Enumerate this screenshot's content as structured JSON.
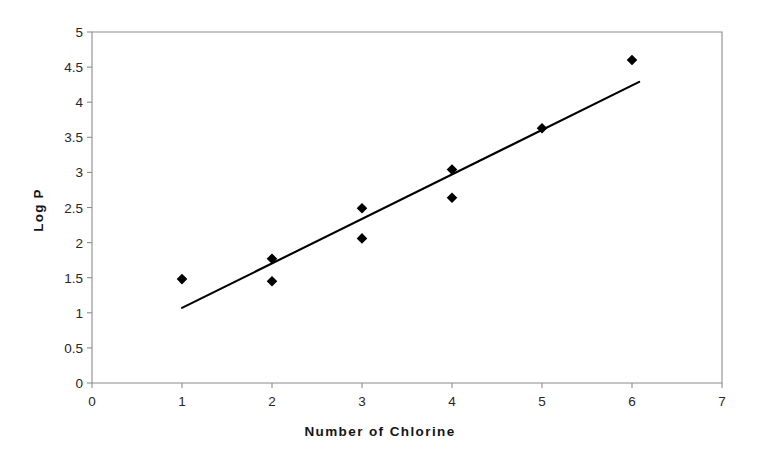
{
  "chart_data": {
    "type": "scatter",
    "title": "",
    "subtitle": "",
    "xlabel": "Number of Chlorine",
    "ylabel": "Log P",
    "xlim": [
      0,
      7
    ],
    "ylim": [
      0,
      5
    ],
    "xticks": [
      0,
      1,
      2,
      3,
      4,
      5,
      6,
      7
    ],
    "xtick_labels": [
      "0",
      "1",
      "2",
      "3",
      "4",
      "5",
      "6",
      "7"
    ],
    "yticks": [
      0,
      0.5,
      1,
      1.5,
      2,
      2.5,
      3,
      3.5,
      4,
      4.5,
      5
    ],
    "ytick_labels": [
      "0",
      "0.5",
      "1",
      "1.5",
      "2",
      "2.5",
      "3",
      "3.5",
      "4",
      "4.5",
      "5"
    ],
    "grid": false,
    "legend": null,
    "marker": "diamond",
    "marker_color": "#000000",
    "frame_color": "#8c8c8c",
    "points": [
      {
        "x": 1,
        "y": 1.48
      },
      {
        "x": 2,
        "y": 1.77
      },
      {
        "x": 2,
        "y": 1.45
      },
      {
        "x": 3,
        "y": 2.49
      },
      {
        "x": 3,
        "y": 2.06
      },
      {
        "x": 4,
        "y": 3.04
      },
      {
        "x": 4,
        "y": 2.64
      },
      {
        "x": 5,
        "y": 3.63
      },
      {
        "x": 6,
        "y": 4.6
      }
    ],
    "trendline": {
      "type": "line",
      "color": "#000000",
      "x_start": 1.0,
      "y_start": 1.07,
      "x_end": 6.08,
      "y_end": 4.29
    }
  }
}
